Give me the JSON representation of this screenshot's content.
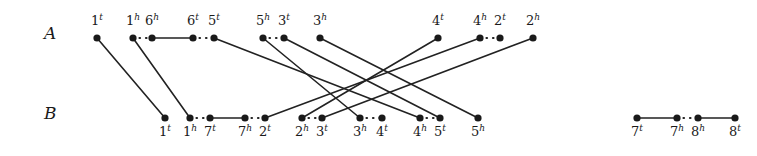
{
  "figure": {
    "width": 757,
    "height": 156,
    "background": "#ffffff",
    "ink_color": "#1a1a1a",
    "line_color": "#222222",
    "node_radius": 3.6,
    "row_label_A": "A",
    "row_label_B": "B",
    "row_A_y": 38,
    "row_B_y": 118,
    "row_label_A_pos": {
      "x": 44,
      "y": 23
    },
    "row_label_B_pos": {
      "x": 44,
      "y": 103
    }
  },
  "nodes": {
    "A": [
      {
        "id": "A-1t",
        "base": "1",
        "sup": "t",
        "x": 97,
        "y": 38,
        "label_y": 14
      },
      {
        "id": "A-1h",
        "base": "1",
        "sup": "h",
        "x": 133,
        "y": 38,
        "label_y": 14
      },
      {
        "id": "A-6h",
        "base": "6",
        "sup": "h",
        "x": 152,
        "y": 38,
        "label_y": 14
      },
      {
        "id": "A-6t",
        "base": "6",
        "sup": "t",
        "x": 193,
        "y": 38,
        "label_y": 14
      },
      {
        "id": "A-5t",
        "base": "5",
        "sup": "t",
        "x": 214,
        "y": 38,
        "label_y": 14
      },
      {
        "id": "A-5h",
        "base": "5",
        "sup": "h",
        "x": 263,
        "y": 38,
        "label_y": 14
      },
      {
        "id": "A-3t",
        "base": "3",
        "sup": "t",
        "x": 284,
        "y": 38,
        "label_y": 14
      },
      {
        "id": "A-3h",
        "base": "3",
        "sup": "h",
        "x": 320,
        "y": 38,
        "label_y": 14
      },
      {
        "id": "A-4t",
        "base": "4",
        "sup": "t",
        "x": 438,
        "y": 38,
        "label_y": 14
      },
      {
        "id": "A-4h",
        "base": "4",
        "sup": "h",
        "x": 480,
        "y": 38,
        "label_y": 14
      },
      {
        "id": "A-2t",
        "base": "2",
        "sup": "t",
        "x": 500,
        "y": 38,
        "label_y": 14
      },
      {
        "id": "A-2h",
        "base": "2",
        "sup": "h",
        "x": 533,
        "y": 38,
        "label_y": 14
      }
    ],
    "B": [
      {
        "id": "B-1t",
        "base": "1",
        "sup": "t",
        "x": 165,
        "y": 118,
        "label_y": 125
      },
      {
        "id": "B-1h",
        "base": "1",
        "sup": "h",
        "x": 190,
        "y": 118,
        "label_y": 125
      },
      {
        "id": "B-7t",
        "base": "7",
        "sup": "t",
        "x": 210,
        "y": 118,
        "label_y": 125
      },
      {
        "id": "B-7h",
        "base": "7",
        "sup": "h",
        "x": 245,
        "y": 118,
        "label_y": 125
      },
      {
        "id": "B-2t",
        "base": "2",
        "sup": "t",
        "x": 265,
        "y": 118,
        "label_y": 125
      },
      {
        "id": "B-2h",
        "base": "2",
        "sup": "h",
        "x": 302,
        "y": 118,
        "label_y": 125
      },
      {
        "id": "B-3t",
        "base": "3",
        "sup": "t",
        "x": 322,
        "y": 118,
        "label_y": 125
      },
      {
        "id": "B-3h",
        "base": "3",
        "sup": "h",
        "x": 360,
        "y": 118,
        "label_y": 125
      },
      {
        "id": "B-4t",
        "base": "4",
        "sup": "t",
        "x": 382,
        "y": 118,
        "label_y": 125
      },
      {
        "id": "B-4h",
        "base": "4",
        "sup": "h",
        "x": 420,
        "y": 118,
        "label_y": 125
      },
      {
        "id": "B-5t",
        "base": "5",
        "sup": "t",
        "x": 440,
        "y": 118,
        "label_y": 125
      },
      {
        "id": "B-5h",
        "base": "5",
        "sup": "h",
        "x": 478,
        "y": 118,
        "label_y": 125
      },
      {
        "id": "B-7t2",
        "base": "7",
        "sup": "t",
        "x": 637,
        "y": 118,
        "label_y": 125
      },
      {
        "id": "B-7h2",
        "base": "7",
        "sup": "h",
        "x": 677,
        "y": 118,
        "label_y": 125
      },
      {
        "id": "B-8h",
        "base": "8",
        "sup": "h",
        "x": 698,
        "y": 118,
        "label_y": 125
      },
      {
        "id": "B-8t",
        "base": "8",
        "sup": "t",
        "x": 735,
        "y": 118,
        "label_y": 125
      }
    ]
  },
  "edges": {
    "solid_cross": [
      {
        "from": "A-1t",
        "to": "B-1t",
        "x1": 97,
        "y1": 38,
        "x2": 165,
        "y2": 118
      },
      {
        "from": "A-1h",
        "to": "B-1h",
        "x1": 133,
        "y1": 38,
        "x2": 190,
        "y2": 118
      },
      {
        "from": "A-5t",
        "to": "B-4h",
        "x1": 214,
        "y1": 38,
        "x2": 420,
        "y2": 118
      },
      {
        "from": "A-5h",
        "to": "B-3h",
        "x1": 263,
        "y1": 38,
        "x2": 360,
        "y2": 118
      },
      {
        "from": "A-3t",
        "to": "B-5t",
        "x1": 284,
        "y1": 38,
        "x2": 440,
        "y2": 118
      },
      {
        "from": "A-3h",
        "to": "B-5h",
        "x1": 320,
        "y1": 38,
        "x2": 478,
        "y2": 118
      },
      {
        "from": "A-4t",
        "to": "B-2h",
        "x1": 438,
        "y1": 38,
        "x2": 302,
        "y2": 118
      },
      {
        "from": "A-4h",
        "to": "B-2t",
        "x1": 480,
        "y1": 38,
        "x2": 265,
        "y2": 118
      },
      {
        "from": "A-2h",
        "to": "B-3t",
        "x1": 533,
        "y1": 38,
        "x2": 322,
        "y2": 118
      }
    ],
    "solid_within": [
      {
        "from": "A-6h",
        "to": "A-6t",
        "x1": 152,
        "y1": 38,
        "x2": 193,
        "y2": 38
      },
      {
        "from": "B-7t",
        "to": "B-7h",
        "x1": 210,
        "y1": 118,
        "x2": 245,
        "y2": 118
      },
      {
        "from": "B-7t2",
        "to": "B-7h2",
        "x1": 637,
        "y1": 118,
        "x2": 677,
        "y2": 118
      },
      {
        "from": "B-8h",
        "to": "B-8t",
        "x1": 698,
        "y1": 118,
        "x2": 735,
        "y2": 118
      }
    ],
    "dotted": [
      {
        "from": "A-1h",
        "to": "A-6h",
        "x1": 133,
        "y1": 38,
        "x2": 152,
        "y2": 38
      },
      {
        "from": "A-6t",
        "to": "A-5t",
        "x1": 193,
        "y1": 38,
        "x2": 214,
        "y2": 38
      },
      {
        "from": "A-5h",
        "to": "A-3t",
        "x1": 263,
        "y1": 38,
        "x2": 284,
        "y2": 38
      },
      {
        "from": "A-4h",
        "to": "A-2t",
        "x1": 480,
        "y1": 38,
        "x2": 500,
        "y2": 38
      },
      {
        "from": "B-1h",
        "to": "B-7t",
        "x1": 190,
        "y1": 118,
        "x2": 210,
        "y2": 118
      },
      {
        "from": "B-7h",
        "to": "B-2t",
        "x1": 245,
        "y1": 118,
        "x2": 265,
        "y2": 118
      },
      {
        "from": "B-2h",
        "to": "B-3t",
        "x1": 302,
        "y1": 118,
        "x2": 322,
        "y2": 118
      },
      {
        "from": "B-3h",
        "to": "B-4t",
        "x1": 360,
        "y1": 118,
        "x2": 382,
        "y2": 118
      },
      {
        "from": "B-4h",
        "to": "B-5t",
        "x1": 420,
        "y1": 118,
        "x2": 440,
        "y2": 118
      },
      {
        "from": "B-7h2",
        "to": "B-8h",
        "x1": 677,
        "y1": 118,
        "x2": 698,
        "y2": 118
      }
    ]
  }
}
